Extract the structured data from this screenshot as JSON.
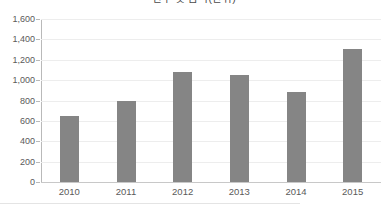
{
  "chart_data": {
    "type": "bar",
    "title": "건수 및 금액(단위)",
    "title_note": "title is clipped by the top edge of the screenshot and not legible",
    "xlabel": "",
    "ylabel": "",
    "categories": [
      "2010",
      "2011",
      "2012",
      "2013",
      "2014",
      "2015"
    ],
    "values": [
      650,
      800,
      1080,
      1050,
      880,
      1310
    ],
    "series": [
      {
        "name": "series-1",
        "values": [
          650,
          800,
          1080,
          1050,
          880,
          1310
        ]
      }
    ],
    "ylim": [
      0,
      1600
    ],
    "ytick_values": [
      0,
      200,
      400,
      600,
      800,
      1000,
      1200,
      1400,
      1600
    ],
    "ytick_labels": [
      "0",
      "200",
      "400",
      "600",
      "800",
      "1,000",
      "1,200",
      "1,400",
      "1,600"
    ],
    "grid": true,
    "legend": false,
    "legend_position": "none",
    "bar_color": "#858585",
    "gridline_color": "#ededed",
    "axis_color": "#b9b9b9",
    "text_color": "#5a5a5a",
    "background_color": "#ffffff"
  }
}
